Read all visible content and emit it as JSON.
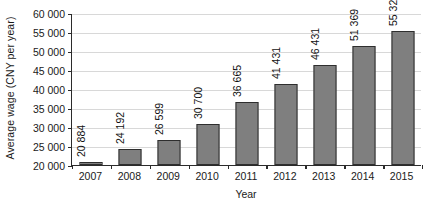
{
  "chart_data": {
    "type": "bar",
    "title": "",
    "xlabel": "Year",
    "ylabel": "Average wage (CNY per year)",
    "categories": [
      "2007",
      "2008",
      "2009",
      "2010",
      "2011",
      "2012",
      "2013",
      "2014",
      "2015"
    ],
    "values": [
      20884,
      24192,
      26599,
      30700,
      36665,
      41431,
      46431,
      51369,
      55324
    ],
    "value_labels": [
      "20 884",
      "24 192",
      "26 599",
      "30 700",
      "36 665",
      "41 431",
      "46 431",
      "51 369",
      "55 324"
    ],
    "ylim": [
      20000,
      60000
    ],
    "ytick_values": [
      20000,
      25000,
      30000,
      35000,
      40000,
      45000,
      50000,
      55000,
      60000
    ],
    "ytick_labels": [
      "20 000",
      "25 000",
      "30 000",
      "35 000",
      "40 000",
      "45 000",
      "50 000",
      "55 000",
      "60 000"
    ],
    "grid": true,
    "grid_axis": "y",
    "legend": false,
    "legend_position": "none",
    "bar_color": "#7f7f7f",
    "bar_edge_color": "#2e2e2e",
    "grid_color": "#d8d8d8",
    "axis_color": "#2b2b2b",
    "background_color": "#ffffff",
    "data_labels_rotation": 90
  }
}
